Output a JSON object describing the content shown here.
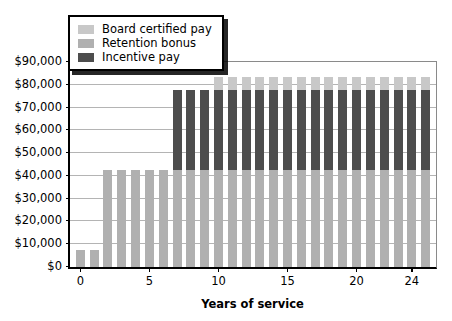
{
  "chart_data": {
    "type": "bar",
    "subtype": "stacked-bar",
    "title": "",
    "xlabel": "Years of service",
    "ylabel": "",
    "xlim": [
      -0.75,
      25.75
    ],
    "ylim": [
      0,
      90000
    ],
    "grid": true,
    "legend_position": "top-left",
    "x": [
      0,
      1,
      2,
      3,
      4,
      5,
      6,
      7,
      8,
      9,
      10,
      11,
      12,
      13,
      14,
      15,
      16,
      17,
      18,
      19,
      20,
      21,
      22,
      23,
      24,
      25
    ],
    "categories": [
      "0",
      "1",
      "2",
      "3",
      "4",
      "5",
      "6",
      "7",
      "8",
      "9",
      "10",
      "11",
      "12",
      "13",
      "14",
      "15",
      "16",
      "17",
      "18",
      "19",
      "20",
      "21",
      "22",
      "23",
      "24",
      "25"
    ],
    "series": [
      {
        "name": "Retention bonus",
        "color": "#b0b0b0",
        "values": [
          7500,
          7500,
          42500,
          42500,
          42500,
          42500,
          42500,
          42500,
          42500,
          42500,
          42500,
          42500,
          42500,
          42500,
          42500,
          42500,
          42500,
          42500,
          42500,
          42500,
          42500,
          42500,
          42500,
          42500,
          42500,
          42500
        ]
      },
      {
        "name": "Incentive pay",
        "color": "#4d4d4d",
        "values": [
          0,
          0,
          0,
          0,
          0,
          0,
          0,
          35000,
          35000,
          35000,
          35000,
          35000,
          35000,
          35000,
          35000,
          35000,
          35000,
          35000,
          35000,
          35000,
          35000,
          35000,
          35000,
          35000,
          35000,
          35000
        ]
      },
      {
        "name": "Board certified pay",
        "color": "#c8c8c8",
        "values": [
          0,
          0,
          0,
          0,
          0,
          0,
          0,
          0,
          0,
          0,
          6000,
          6000,
          6000,
          6000,
          6000,
          6000,
          6000,
          6000,
          6000,
          6000,
          6000,
          6000,
          6000,
          6000,
          6000,
          6000
        ]
      }
    ],
    "stack_order_bottom_to_top": [
      "Retention bonus",
      "Incentive pay",
      "Board certified pay"
    ],
    "totals": [
      7500,
      7500,
      42500,
      42500,
      42500,
      42500,
      42500,
      77500,
      77500,
      77500,
      83500,
      83500,
      83500,
      83500,
      83500,
      83500,
      83500,
      83500,
      83500,
      83500,
      83500,
      83500,
      83500,
      83500,
      83500,
      83500
    ],
    "y_ticks": [
      0,
      10000,
      20000,
      30000,
      40000,
      50000,
      60000,
      70000,
      80000,
      90000
    ],
    "y_tick_labels": [
      "$0",
      "$10,000",
      "$20,000",
      "$30,000",
      "$40,000",
      "$50,000",
      "$60,000",
      "$70,000",
      "$80,000",
      "$90,000"
    ],
    "x_ticks": [
      0,
      5,
      10,
      15,
      20,
      24
    ],
    "x_tick_labels": [
      "0",
      "5",
      "10",
      "15",
      "20",
      "24"
    ]
  },
  "legend": {
    "items": [
      {
        "label": "Board certified pay",
        "color": "#c8c8c8"
      },
      {
        "label": "Retention bonus",
        "color": "#b0b0b0"
      },
      {
        "label": "Incentive pay",
        "color": "#4d4d4d"
      }
    ]
  },
  "axes": {
    "x_title": "Years of service"
  }
}
